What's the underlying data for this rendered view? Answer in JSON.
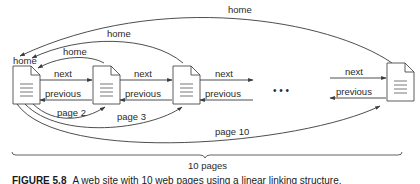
{
  "diagram": {
    "title": "Linear linking structure",
    "pages": [
      {
        "id": "page-1",
        "label": "home"
      },
      {
        "id": "page-2",
        "label": ""
      },
      {
        "id": "page-3",
        "label": ""
      },
      {
        "id": "page-10",
        "label": ""
      }
    ],
    "links": {
      "next": "next",
      "previous": "previous",
      "home": "home",
      "page2": "page 2",
      "page3": "page 3",
      "page10": "page 10"
    },
    "ellipsis": "• • •",
    "brace_label": "10 pages",
    "colors": {
      "line": "#3a3a3a",
      "doc_fill": "#ffffff",
      "doc_stroke": "#4a4a4a"
    }
  },
  "caption": {
    "figure_number": "FIGURE 5.8",
    "text": "A web site with 10 web pages using a linear linking structure."
  }
}
